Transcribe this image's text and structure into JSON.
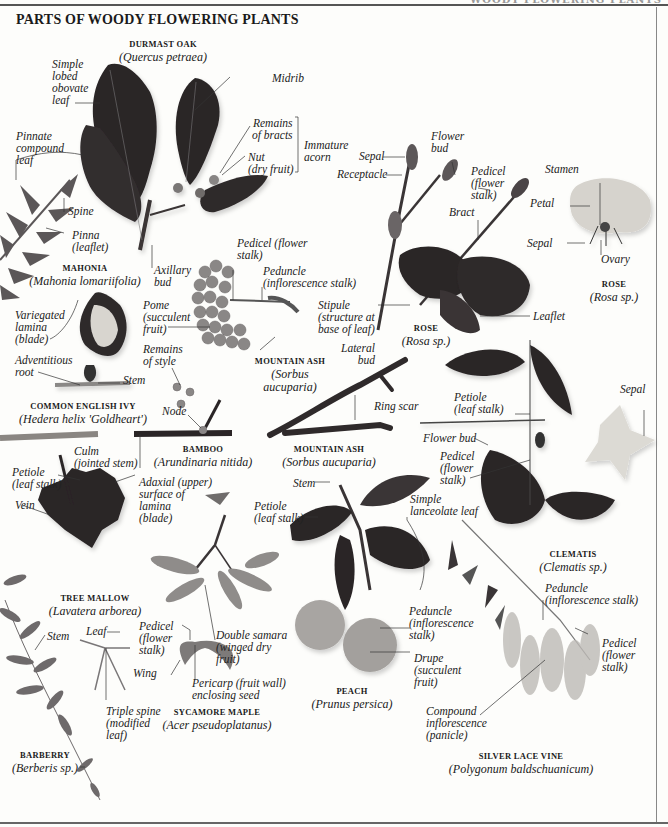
{
  "page": {
    "title": "PARTS OF WOODY FLOWERING PLANTS",
    "running_head": "WOODY FLOWERING PLANTS"
  },
  "specimens": [
    {
      "id": "durmast-oak",
      "name": "DURMAST OAK",
      "scientific": "(Quercus petraea)"
    },
    {
      "id": "mahonia",
      "name": "MAHONIA",
      "scientific": "(Mahonia lomariifolia)"
    },
    {
      "id": "rose-shoot",
      "name": "ROSE",
      "scientific": "(Rosa sp.)"
    },
    {
      "id": "rose-flower",
      "name": "ROSE",
      "scientific": "(Rosa sp.)"
    },
    {
      "id": "mountain-ash-fruit",
      "name": "MOUNTAIN ASH",
      "scientific": "(Sorbus aucuparia)"
    },
    {
      "id": "common-english-ivy",
      "name": "COMMON ENGLISH IVY",
      "scientific": "(Hedera helix 'Goldheart')"
    },
    {
      "id": "bamboo",
      "name": "BAMBOO",
      "scientific": "(Arundinaria nitida)"
    },
    {
      "id": "mountain-ash-twig",
      "name": "MOUNTAIN ASH",
      "scientific": "(Sorbus aucuparia)"
    },
    {
      "id": "clematis",
      "name": "CLEMATIS",
      "scientific": "(Clematis sp.)"
    },
    {
      "id": "tree-mallow",
      "name": "TREE MALLOW",
      "scientific": "(Lavatera arborea)"
    },
    {
      "id": "sycamore-maple",
      "name": "SYCAMORE MAPLE",
      "scientific": "(Acer pseudoplatanus)"
    },
    {
      "id": "peach",
      "name": "PEACH",
      "scientific": "(Prunus persica)"
    },
    {
      "id": "silver-lace-vine",
      "name": "SILVER LACE VINE",
      "scientific": "(Polygonum baldschuanicum)"
    },
    {
      "id": "barberry",
      "name": "BARBERRY",
      "scientific": "(Berberis sp.)"
    }
  ],
  "labels": {
    "oak_simple_leaf": "Simple\nlobed\nobovate\nleaf",
    "oak_midrib": "Midrib",
    "oak_remains_bracts": "Remains\nof bracts",
    "oak_nut": "Nut\n(dry fruit)",
    "oak_immature_acorn": "Immature\nacorn",
    "oak_axillary_bud": "Axillary\nbud",
    "mahonia_pinnate": "Pinnate\ncompound\nleaf",
    "mahonia_spine": "Spine",
    "mahonia_pinna": "Pinna\n(leaflet)",
    "rose_sepal": "Sepal",
    "rose_receptacle": "Receptacle",
    "rose_flower_bud": "Flower\nbud",
    "rose_pedicel": "Pedicel\n(flower\nstalk)",
    "rose_bract": "Bract",
    "rose_stipule": "Stipule\n(structure at\nbase of leaf)",
    "rose_leaflet": "Leaflet",
    "roseflower_stamen": "Stamen",
    "roseflower_petal": "Petal",
    "roseflower_sepal": "Sepal",
    "roseflower_ovary": "Ovary",
    "ash_pedicel": "Pedicel (flower\nstalk)",
    "ash_peduncle": "Peduncle\n(inflorescence stalk)",
    "ash_pome": "Pome\n(succulent\nfruit)",
    "ash_remains_style": "Remains\nof style",
    "ivy_variegated": "Variegated\nlamina\n(blade)",
    "ivy_adventitious": "Adventitious\nroot",
    "ivy_stem": "Stem",
    "bamboo_node": "Node",
    "bamboo_culm": "Culm\n(jointed stem)",
    "twig_lateral_bud": "Lateral\nbud",
    "twig_ring_scar": "Ring scar",
    "clem_petiole": "Petiole\n(leaf stalk)",
    "clem_sepal": "Sepal",
    "clem_flower_bud": "Flower bud",
    "clem_pedicel": "Pedicel\n(flower\nstalk)",
    "mallow_petiole": "Petiole\n(leaf stalk)",
    "mallow_vein": "Vein",
    "mallow_adaxial": "Adaxial (upper)\nsurface of\nlamina\n(blade)",
    "peach_stem": "Stem",
    "peach_petiole": "Petiole\n(leaf stalk)",
    "peach_simple_leaf": "Simple\nlanceolate leaf",
    "peach_peduncle": "Peduncle\n(inflorescence\nstalk)",
    "peach_drupe": "Drupe\n(succulent\nfruit)",
    "maple_pedicel": "Pedicel\n(flower\nstalk)",
    "maple_double_samara": "Double samara\n(winged dry\nfruit)",
    "maple_wing": "Wing",
    "maple_pericarp": "Pericarp (fruit wall)\nenclosing seed",
    "barberry_stem": "Stem",
    "barberry_leaf": "Leaf",
    "barberry_triple_spine": "Triple spine\n(modified\nleaf)",
    "vine_peduncle": "Peduncle\n(inflorescence stalk)",
    "vine_pedicel": "Pedicel\n(flower\nstalk)",
    "vine_compound": "Compound\ninflorescence\n(panicle)"
  },
  "colors": {
    "leaf_dark": "#2a2526",
    "leaf_mid": "#4a4446",
    "leaf_grey": "#6e6a6b",
    "fruit_grey": "#8d8a89",
    "peach": "#a9a6a3",
    "flower_light": "#d9d7d2",
    "leader_line": "#333333"
  }
}
